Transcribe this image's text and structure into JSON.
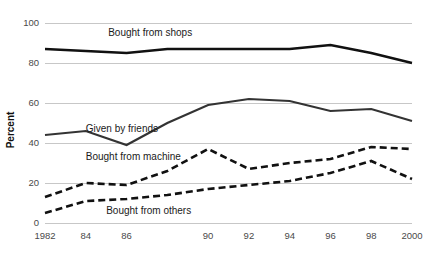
{
  "chart_data": {
    "type": "line",
    "title": "",
    "xlabel": "",
    "ylabel": "Percent",
    "ylim": [
      0,
      100
    ],
    "xlim": [
      1982,
      2000
    ],
    "yticks": [
      0,
      20,
      40,
      60,
      80,
      100
    ],
    "ytick_labels": [
      "0",
      "20",
      "40",
      "60",
      "80",
      "100"
    ],
    "xticks": [
      1982,
      1984,
      1986,
      1988,
      1990,
      1992,
      1994,
      1996,
      1998,
      2000
    ],
    "xtick_labels": [
      "1982",
      "84",
      "86",
      "",
      "90",
      "92",
      "94",
      "96",
      "98",
      "2000"
    ],
    "grid": "horizontal",
    "legend": "inline-annotations",
    "x": [
      1982,
      1984,
      1986,
      1988,
      1990,
      1992,
      1994,
      1996,
      1998,
      2000
    ],
    "series": [
      {
        "name": "Bought from shops",
        "style": "solid",
        "color": "#111111",
        "values": [
          87,
          86,
          85,
          87,
          87,
          87,
          87,
          89,
          85,
          80
        ],
        "label_x": 1985.1,
        "label_y": 95
      },
      {
        "name": "Given by friends",
        "style": "solid",
        "color": "#333333",
        "values": [
          44,
          46,
          39,
          50,
          59,
          62,
          61,
          56,
          57,
          51
        ],
        "label_x": 1984.0,
        "label_y": 47
      },
      {
        "name": "Bought from machine",
        "style": "dashed",
        "color": "#111111",
        "values": [
          13,
          20,
          19,
          26,
          37,
          27,
          30,
          32,
          38,
          37
        ],
        "label_x": 1984.0,
        "label_y": 33
      },
      {
        "name": "Bought from others",
        "style": "dashed",
        "color": "#111111",
        "values": [
          5,
          11,
          12,
          14,
          17,
          19,
          21,
          25,
          31,
          22
        ],
        "label_x": 1985.0,
        "label_y": 6
      }
    ]
  }
}
